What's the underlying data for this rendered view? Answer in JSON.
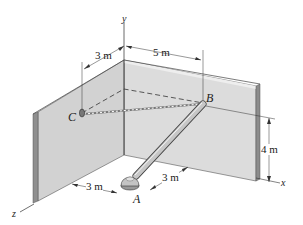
{
  "figure": {
    "points": {
      "A": "A",
      "B": "B",
      "C": "C"
    },
    "axes": {
      "x": "x",
      "y": "y",
      "z": "z"
    },
    "dimensions": {
      "c_offset_z": "3 m",
      "b_offset_x": "5 m",
      "b_height": "4 m",
      "a_offset_z": "3 m",
      "a_offset_x": "3 m"
    },
    "colors": {
      "wall_face": "#d9d9d9",
      "wall_edge": "#8f8f8f",
      "pole": "#c8c8c8",
      "line": "#333333"
    }
  }
}
